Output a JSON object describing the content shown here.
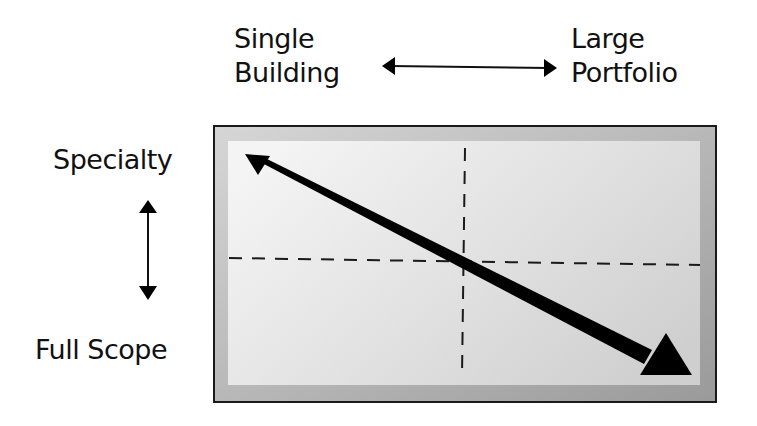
{
  "axes": {
    "horizontal": {
      "left_label": "Single\nBuilding",
      "left_label_lines": [
        "Single",
        "Building"
      ],
      "right_label_lines": [
        "Large",
        "Portfolio"
      ]
    },
    "vertical": {
      "top_label": "Specialty",
      "bottom_label": "Full Scope"
    }
  },
  "icons": {
    "horizontal_axis_arrow": "double-headed-horizontal-arrow",
    "vertical_axis_arrow": "double-headed-vertical-arrow",
    "trend_arrow": "tapered-diagonal-arrow"
  },
  "colors": {
    "frame_outer": "#a8a8a8",
    "frame_inner": "#e4e4e4",
    "border": "#1a1a1a",
    "ink": "#000000"
  }
}
